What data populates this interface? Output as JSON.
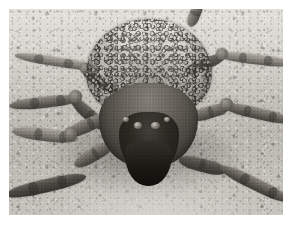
{
  "photo": {
    "subject": "Wolf spider carrying spiderlings on its abdomen",
    "scene_description": "Close-up frontal view of a wolf spider standing on pale sandy ground, its abdomen densely covered with dozens of tiny spiderlings",
    "orientation": "landscape",
    "frame": {
      "canvas_width": 290,
      "canvas_height": 226,
      "image_left": 9,
      "image_top": 9,
      "image_width": 274,
      "image_height": 206,
      "border_color": "#ffffff"
    },
    "palette": {
      "sand_light": "#d7d4cd",
      "sand_mid": "#c6c3bb",
      "sand_shadow": "#9a968d",
      "leg_light": "#a9a59a",
      "leg_mid": "#6e6a61",
      "leg_dark": "#3d3a35",
      "body_mid": "#5c584f",
      "face_dark": "#141210",
      "spiderling_highlight": "#cdc8be"
    },
    "anatomy": {
      "abdomen_label": "abdomen-with-spiderlings",
      "cephalothorax_label": "cephalothorax",
      "face_label": "eye-region",
      "chelicerae_label": "chelicerae",
      "left_legs": [
        "front-left-leg",
        "second-left-leg",
        "third-left-leg",
        "rear-left-leg"
      ],
      "right_legs": [
        "front-right-leg",
        "second-right-leg",
        "third-right-leg",
        "rear-right-leg"
      ]
    },
    "notes": {
      "focus": "shallow depth of field, sharp on the spider's carapace",
      "lighting": "bright overhead daylight casting a dark shadow beneath the body",
      "color": "near-monochrome warm grey"
    }
  }
}
